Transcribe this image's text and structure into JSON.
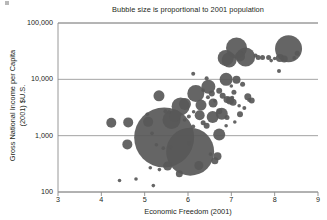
{
  "chart_data": {
    "type": "scatter",
    "title": "Bubble size is proportional to 2001 population",
    "xlabel": "Economic Freedom (2001)",
    "ylabel_line1": "Gross National Income per Capita",
    "ylabel_line2": "(2001) $U.S.",
    "xlim": [
      3,
      9
    ],
    "ylim": [
      100,
      100000
    ],
    "yscale": "log",
    "xscale": "linear",
    "grid": true,
    "legend": "none",
    "xticks": [
      "3",
      "4",
      "5",
      "6",
      "7",
      "8",
      "9"
    ],
    "xtick_values": [
      3,
      4,
      5,
      6,
      7,
      8,
      9
    ],
    "yticks": [
      "100",
      "1,000",
      "10,000",
      "100,000"
    ],
    "ytick_values": [
      100,
      1000,
      10000,
      100000
    ],
    "bubble_color": "#585858",
    "size_encoding": "Bubble area proportional to 2001 population",
    "points": [
      {
        "x": 5.45,
        "y": 930,
        "r": 30.0
      },
      {
        "x": 6.05,
        "y": 520,
        "r": 24.0
      },
      {
        "x": 8.32,
        "y": 35000,
        "r": 13.5
      },
      {
        "x": 7.12,
        "y": 36000,
        "r": 10.5
      },
      {
        "x": 5.62,
        "y": 1900,
        "r": 9.0
      },
      {
        "x": 7.33,
        "y": 25000,
        "r": 9.5
      },
      {
        "x": 6.18,
        "y": 5600,
        "r": 8.5
      },
      {
        "x": 5.83,
        "y": 3300,
        "r": 9.0
      },
      {
        "x": 6.95,
        "y": 22000,
        "r": 7.5
      },
      {
        "x": 6.87,
        "y": 24000,
        "r": 8.0
      },
      {
        "x": 6.47,
        "y": 7400,
        "r": 7.0
      },
      {
        "x": 6.88,
        "y": 10000,
        "r": 6.5
      },
      {
        "x": 6.72,
        "y": 1050,
        "r": 6.0
      },
      {
        "x": 5.93,
        "y": 3650,
        "r": 6.0
      },
      {
        "x": 5.7,
        "y": 2250,
        "r": 6.0
      },
      {
        "x": 6.57,
        "y": 2150,
        "r": 6.0
      },
      {
        "x": 6.78,
        "y": 2450,
        "r": 6.0
      },
      {
        "x": 6.3,
        "y": 3500,
        "r": 5.5
      },
      {
        "x": 5.33,
        "y": 5100,
        "r": 5.5
      },
      {
        "x": 4.23,
        "y": 1700,
        "r": 5.0
      },
      {
        "x": 4.62,
        "y": 1720,
        "r": 5.0
      },
      {
        "x": 5.08,
        "y": 1760,
        "r": 5.0
      },
      {
        "x": 4.6,
        "y": 700,
        "r": 5.0
      },
      {
        "x": 7.2,
        "y": 25500,
        "r": 5.0
      },
      {
        "x": 6.27,
        "y": 2300,
        "r": 5.0
      },
      {
        "x": 6.58,
        "y": 3800,
        "r": 4.5
      },
      {
        "x": 6.97,
        "y": 4200,
        "r": 4.0
      },
      {
        "x": 7.12,
        "y": 9800,
        "r": 4.0
      },
      {
        "x": 6.25,
        "y": 295,
        "r": 4.5
      },
      {
        "x": 6.68,
        "y": 430,
        "r": 4.0
      },
      {
        "x": 8.12,
        "y": 24000,
        "r": 4.0
      },
      {
        "x": 8.22,
        "y": 23000,
        "r": 3.5
      },
      {
        "x": 5.53,
        "y": 290,
        "r": 4.5
      },
      {
        "x": 5.8,
        "y": 210,
        "r": 3.5
      },
      {
        "x": 6.62,
        "y": 360,
        "r": 3.5
      },
      {
        "x": 7.04,
        "y": 3900,
        "r": 3.5
      },
      {
        "x": 6.9,
        "y": 4400,
        "r": 3.5
      },
      {
        "x": 7.38,
        "y": 4900,
        "r": 3.5
      },
      {
        "x": 6.43,
        "y": 1500,
        "r": 3.0
      },
      {
        "x": 6.72,
        "y": 2700,
        "r": 3.0
      },
      {
        "x": 6.8,
        "y": 5100,
        "r": 3.0
      },
      {
        "x": 7.47,
        "y": 4200,
        "r": 3.0
      },
      {
        "x": 7.2,
        "y": 2400,
        "r": 3.0
      },
      {
        "x": 6.55,
        "y": 5600,
        "r": 3.0
      },
      {
        "x": 6.72,
        "y": 6300,
        "r": 3.0
      },
      {
        "x": 7.26,
        "y": 8200,
        "r": 2.5
      },
      {
        "x": 7.06,
        "y": 5900,
        "r": 2.5
      },
      {
        "x": 7.62,
        "y": 24500,
        "r": 2.5
      },
      {
        "x": 7.72,
        "y": 24500,
        "r": 2.5
      },
      {
        "x": 7.86,
        "y": 24500,
        "r": 2.5
      },
      {
        "x": 7.56,
        "y": 26500,
        "r": 2.0
      },
      {
        "x": 8.52,
        "y": 29000,
        "r": 2.5
      },
      {
        "x": 8.1,
        "y": 14000,
        "r": 2.0
      },
      {
        "x": 6.12,
        "y": 12500,
        "r": 2.0
      },
      {
        "x": 6.43,
        "y": 10500,
        "r": 2.0
      },
      {
        "x": 6.9,
        "y": 2100,
        "r": 2.5
      },
      {
        "x": 6.35,
        "y": 1700,
        "r": 2.5
      },
      {
        "x": 5.48,
        "y": 2700,
        "r": 2.0
      },
      {
        "x": 6.02,
        "y": 2200,
        "r": 2.0
      },
      {
        "x": 6.12,
        "y": 1450,
        "r": 2.0
      },
      {
        "x": 6.46,
        "y": 4800,
        "r": 2.0
      },
      {
        "x": 7.02,
        "y": 4700,
        "r": 2.0
      },
      {
        "x": 7.3,
        "y": 3100,
        "r": 2.0
      },
      {
        "x": 7.41,
        "y": 4300,
        "r": 2.0
      },
      {
        "x": 4.42,
        "y": 160,
        "r": 1.8
      },
      {
        "x": 4.8,
        "y": 170,
        "r": 1.8
      },
      {
        "x": 5.2,
        "y": 130,
        "r": 1.8
      },
      {
        "x": 5.13,
        "y": 270,
        "r": 1.8
      },
      {
        "x": 5.34,
        "y": 250,
        "r": 1.8
      },
      {
        "x": 5.27,
        "y": 690,
        "r": 1.8
      },
      {
        "x": 5.43,
        "y": 600,
        "r": 1.8
      },
      {
        "x": 5.6,
        "y": 620,
        "r": 1.8
      },
      {
        "x": 5.17,
        "y": 1100,
        "r": 1.8
      },
      {
        "x": 5.06,
        "y": 2400,
        "r": 1.8
      },
      {
        "x": 5.56,
        "y": 2650,
        "r": 1.8
      },
      {
        "x": 5.92,
        "y": 1900,
        "r": 1.8
      },
      {
        "x": 6.13,
        "y": 2650,
        "r": 1.8
      },
      {
        "x": 6.88,
        "y": 1500,
        "r": 1.8
      },
      {
        "x": 7.08,
        "y": 1750,
        "r": 1.8
      },
      {
        "x": 7.18,
        "y": 3400,
        "r": 1.8
      },
      {
        "x": 6.62,
        "y": 4150,
        "r": 1.8
      },
      {
        "x": 6.35,
        "y": 6400,
        "r": 1.8
      },
      {
        "x": 7.0,
        "y": 7600,
        "r": 1.8
      },
      {
        "x": 6.52,
        "y": 470,
        "r": 1.8
      },
      {
        "x": 6.02,
        "y": 730,
        "r": 1.8
      },
      {
        "x": 8.45,
        "y": 24000,
        "r": 1.8
      },
      {
        "x": 8.0,
        "y": 23500,
        "r": 1.8
      },
      {
        "x": 7.92,
        "y": 21500,
        "r": 1.8
      }
    ]
  }
}
